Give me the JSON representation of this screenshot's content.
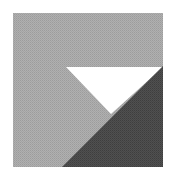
{
  "figure": {
    "colors": {
      "background": "#ffffff",
      "square_fill": "#a9a9a9",
      "white_triangle": "#ffffff",
      "dark_triangle": "#4a4a4a"
    },
    "shapes": {
      "square": {
        "x": 13,
        "y": 13,
        "width": 150,
        "height": 154
      },
      "white_triangle_points": "66,67 163,67 111,114",
      "dark_triangle_points": "163,66 163,167 62,167"
    }
  }
}
